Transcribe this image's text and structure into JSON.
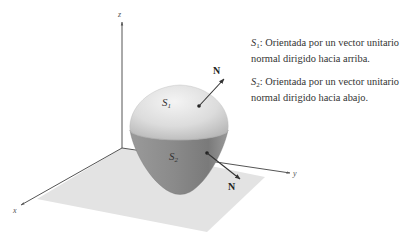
{
  "figure": {
    "axes": {
      "x_label": "x",
      "y_label": "y",
      "z_label": "z"
    },
    "surfaces": [
      {
        "symbol": "S",
        "subscript": "1",
        "normal_label": "N",
        "shade": "#d9d9d9"
      },
      {
        "symbol": "S",
        "subscript": "2",
        "normal_label": "N",
        "shade": "#8e8e8e"
      }
    ],
    "plane_color": "#e4e4e4"
  },
  "captions": [
    {
      "symbol": "S",
      "subscript": "1",
      "text": ": Orientada por un vector unitario normal dirigido hacia arriba."
    },
    {
      "symbol": "S",
      "subscript": "2",
      "text": ": Orientada por un vector unitario normal dirigido hacia abajo."
    }
  ]
}
